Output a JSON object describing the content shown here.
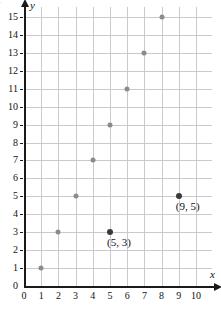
{
  "chart_data": {
    "type": "scatter",
    "title": "",
    "xlabel": "x",
    "ylabel": "y",
    "xlim": [
      0,
      10
    ],
    "ylim": [
      0,
      15
    ],
    "grid": true,
    "legend": null,
    "x_ticks": [
      "0",
      "1",
      "2",
      "3",
      "4",
      "5",
      "6",
      "7",
      "8",
      "9",
      "10"
    ],
    "y_ticks": [
      "0",
      "1",
      "2",
      "3",
      "4",
      "5",
      "6",
      "7",
      "8",
      "9",
      "10",
      "11",
      "12",
      "13",
      "14",
      "15"
    ],
    "points": [
      {
        "x": 1,
        "y": 1,
        "style": "plain",
        "label": null
      },
      {
        "x": 2,
        "y": 3,
        "style": "plain",
        "label": null
      },
      {
        "x": 3,
        "y": 5,
        "style": "plain",
        "label": null
      },
      {
        "x": 4,
        "y": 7,
        "style": "plain",
        "label": null
      },
      {
        "x": 5,
        "y": 9,
        "style": "plain",
        "label": null
      },
      {
        "x": 6,
        "y": 11,
        "style": "plain",
        "label": null
      },
      {
        "x": 7,
        "y": 13,
        "style": "plain",
        "label": null
      },
      {
        "x": 8,
        "y": 15,
        "style": "plain",
        "label": null
      },
      {
        "x": 5,
        "y": 3,
        "style": "marked",
        "label": "(5, 3)"
      },
      {
        "x": 9,
        "y": 5,
        "style": "marked",
        "label": "(9, 5)"
      }
    ],
    "annotations": [
      {
        "text": "(5, 3)",
        "x": 5,
        "y": 3
      },
      {
        "text": "(9, 5)",
        "x": 9,
        "y": 5
      }
    ],
    "colors": {
      "grid": "#c9c9cf",
      "axis": "#1a1a1a",
      "point_plain": "#8a8a90",
      "point_marked": "#3a3a3a",
      "text": "#111111"
    }
  }
}
